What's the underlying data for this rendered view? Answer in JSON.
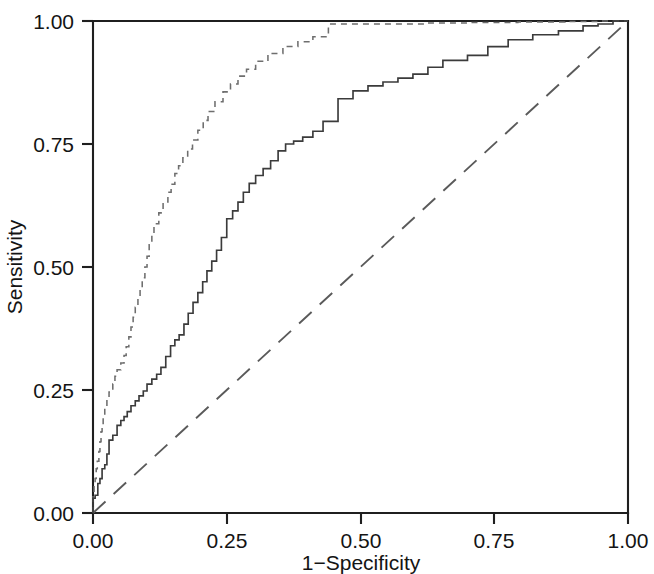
{
  "chart_data": {
    "type": "line",
    "title": "",
    "subtitle": "",
    "xlabel": "1−Specificity",
    "ylabel": "Sensitivity",
    "xlim": [
      0.0,
      1.0
    ],
    "ylim": [
      0.0,
      1.0
    ],
    "grid": false,
    "legend": "none",
    "xticks": [
      0.0,
      0.25,
      0.5,
      0.75,
      1.0
    ],
    "xtick_labels": [
      "0.00",
      "0.25",
      "0.50",
      "0.75",
      "1.00"
    ],
    "yticks": [
      0.0,
      0.25,
      0.5,
      0.75,
      1.0
    ],
    "ytick_labels": [
      "0.00",
      "0.25",
      "0.50",
      "0.75",
      "1.00"
    ],
    "series": [
      {
        "name": "ROC curve 1 (dashed, upper)",
        "style": "dashed",
        "color": "#6e6e6e",
        "x": [
          0.0,
          0.0,
          0.002,
          0.002,
          0.004,
          0.004,
          0.006,
          0.006,
          0.008,
          0.008,
          0.011,
          0.011,
          0.013,
          0.013,
          0.015,
          0.015,
          0.017,
          0.017,
          0.019,
          0.019,
          0.022,
          0.022,
          0.026,
          0.026,
          0.03,
          0.03,
          0.037,
          0.037,
          0.041,
          0.041,
          0.045,
          0.045,
          0.052,
          0.052,
          0.058,
          0.058,
          0.062,
          0.062,
          0.067,
          0.067,
          0.071,
          0.071,
          0.075,
          0.075,
          0.079,
          0.079,
          0.084,
          0.084,
          0.088,
          0.088,
          0.092,
          0.092,
          0.097,
          0.097,
          0.101,
          0.101,
          0.105,
          0.105,
          0.11,
          0.11,
          0.114,
          0.114,
          0.123,
          0.123,
          0.131,
          0.131,
          0.14,
          0.14,
          0.146,
          0.146,
          0.153,
          0.153,
          0.16,
          0.16,
          0.168,
          0.168,
          0.177,
          0.177,
          0.186,
          0.186,
          0.196,
          0.196,
          0.206,
          0.206,
          0.215,
          0.215,
          0.228,
          0.228,
          0.243,
          0.243,
          0.257,
          0.257,
          0.271,
          0.271,
          0.287,
          0.287,
          0.304,
          0.304,
          0.327,
          0.327,
          0.355,
          0.355,
          0.383,
          0.383,
          0.411,
          0.411,
          0.44,
          0.44,
          0.626,
          0.626,
          0.7,
          0.7,
          0.794,
          0.794,
          0.882,
          0.882,
          0.944,
          0.944,
          1.0
        ],
        "y": [
          0.0,
          0.04,
          0.04,
          0.058,
          0.058,
          0.07,
          0.07,
          0.09,
          0.09,
          0.105,
          0.105,
          0.125,
          0.125,
          0.145,
          0.145,
          0.165,
          0.165,
          0.18,
          0.18,
          0.196,
          0.196,
          0.215,
          0.215,
          0.232,
          0.232,
          0.246,
          0.246,
          0.262,
          0.262,
          0.278,
          0.278,
          0.291,
          0.291,
          0.305,
          0.305,
          0.32,
          0.32,
          0.338,
          0.338,
          0.358,
          0.358,
          0.378,
          0.378,
          0.398,
          0.398,
          0.418,
          0.418,
          0.438,
          0.438,
          0.458,
          0.458,
          0.478,
          0.478,
          0.5,
          0.5,
          0.522,
          0.522,
          0.545,
          0.545,
          0.566,
          0.566,
          0.588,
          0.588,
          0.61,
          0.61,
          0.632,
          0.632,
          0.652,
          0.652,
          0.668,
          0.668,
          0.69,
          0.69,
          0.706,
          0.706,
          0.722,
          0.722,
          0.74,
          0.74,
          0.758,
          0.758,
          0.778,
          0.778,
          0.798,
          0.798,
          0.816,
          0.816,
          0.836,
          0.836,
          0.856,
          0.856,
          0.872,
          0.872,
          0.888,
          0.888,
          0.902,
          0.902,
          0.918,
          0.918,
          0.934,
          0.934,
          0.948,
          0.948,
          0.958,
          0.958,
          0.968,
          0.968,
          0.994,
          0.994,
          0.996,
          0.996,
          0.997,
          0.997,
          0.998,
          0.998,
          0.999,
          0.999,
          1.0,
          1.0
        ]
      },
      {
        "name": "ROC curve 2 (solid, lower)",
        "style": "solid",
        "color": "#3b3b3b",
        "x": [
          0.0,
          0.0,
          0.004,
          0.004,
          0.009,
          0.009,
          0.013,
          0.013,
          0.017,
          0.017,
          0.022,
          0.022,
          0.026,
          0.026,
          0.03,
          0.03,
          0.037,
          0.037,
          0.045,
          0.045,
          0.052,
          0.052,
          0.058,
          0.058,
          0.064,
          0.064,
          0.071,
          0.071,
          0.079,
          0.079,
          0.086,
          0.086,
          0.094,
          0.094,
          0.101,
          0.101,
          0.11,
          0.11,
          0.119,
          0.119,
          0.127,
          0.127,
          0.136,
          0.136,
          0.145,
          0.145,
          0.153,
          0.153,
          0.161,
          0.161,
          0.17,
          0.17,
          0.178,
          0.178,
          0.187,
          0.187,
          0.196,
          0.196,
          0.205,
          0.205,
          0.213,
          0.213,
          0.222,
          0.222,
          0.231,
          0.231,
          0.24,
          0.24,
          0.25,
          0.25,
          0.261,
          0.261,
          0.271,
          0.271,
          0.281,
          0.281,
          0.292,
          0.292,
          0.304,
          0.304,
          0.318,
          0.318,
          0.332,
          0.332,
          0.346,
          0.346,
          0.36,
          0.36,
          0.375,
          0.375,
          0.392,
          0.392,
          0.411,
          0.411,
          0.43,
          0.43,
          0.458,
          0.458,
          0.486,
          0.486,
          0.514,
          0.514,
          0.542,
          0.542,
          0.57,
          0.57,
          0.598,
          0.598,
          0.626,
          0.626,
          0.654,
          0.654,
          0.7,
          0.7,
          0.738,
          0.738,
          0.776,
          0.776,
          0.822,
          0.822,
          0.87,
          0.87,
          0.916,
          0.916,
          0.944,
          0.944,
          0.972,
          0.972,
          1.0
        ],
        "y": [
          0.0,
          0.03,
          0.03,
          0.036,
          0.036,
          0.06,
          0.06,
          0.07,
          0.07,
          0.09,
          0.09,
          0.098,
          0.098,
          0.12,
          0.12,
          0.148,
          0.148,
          0.158,
          0.158,
          0.178,
          0.178,
          0.188,
          0.188,
          0.196,
          0.196,
          0.206,
          0.206,
          0.218,
          0.218,
          0.228,
          0.228,
          0.238,
          0.238,
          0.248,
          0.248,
          0.262,
          0.262,
          0.272,
          0.272,
          0.282,
          0.282,
          0.296,
          0.296,
          0.318,
          0.318,
          0.34,
          0.34,
          0.352,
          0.352,
          0.362,
          0.362,
          0.384,
          0.384,
          0.406,
          0.406,
          0.428,
          0.428,
          0.448,
          0.448,
          0.47,
          0.47,
          0.492,
          0.492,
          0.512,
          0.512,
          0.534,
          0.534,
          0.56,
          0.56,
          0.598,
          0.598,
          0.614,
          0.614,
          0.632,
          0.632,
          0.652,
          0.652,
          0.67,
          0.67,
          0.686,
          0.686,
          0.7,
          0.7,
          0.716,
          0.716,
          0.736,
          0.736,
          0.75,
          0.75,
          0.756,
          0.756,
          0.764,
          0.764,
          0.776,
          0.776,
          0.796,
          0.796,
          0.842,
          0.842,
          0.858,
          0.858,
          0.868,
          0.868,
          0.876,
          0.876,
          0.884,
          0.884,
          0.892,
          0.892,
          0.906,
          0.906,
          0.92,
          0.92,
          0.93,
          0.93,
          0.948,
          0.948,
          0.962,
          0.962,
          0.972,
          0.972,
          0.98,
          0.98,
          0.99,
          0.99,
          0.994,
          0.994,
          1.0,
          1.0
        ]
      },
      {
        "name": "Reference diagonal (chance line)",
        "style": "long-dashed",
        "color": "#5a5a5a",
        "x": [
          0.0,
          1.0
        ],
        "y": [
          0.0,
          1.0
        ]
      }
    ]
  },
  "axes": {
    "x_label": "1−Specificity",
    "y_label": "Sensitivity",
    "x_tick_labels": [
      "0.00",
      "0.25",
      "0.50",
      "0.75",
      "1.00"
    ],
    "y_tick_labels": [
      "0.00",
      "0.25",
      "0.50",
      "0.75",
      "1.00"
    ]
  },
  "colors": {
    "axis": "#1f1f1f",
    "curve_solid": "#3b3b3b",
    "curve_dashed": "#6e6e6e",
    "curve_reference": "#5a5a5a",
    "background": "#ffffff"
  }
}
